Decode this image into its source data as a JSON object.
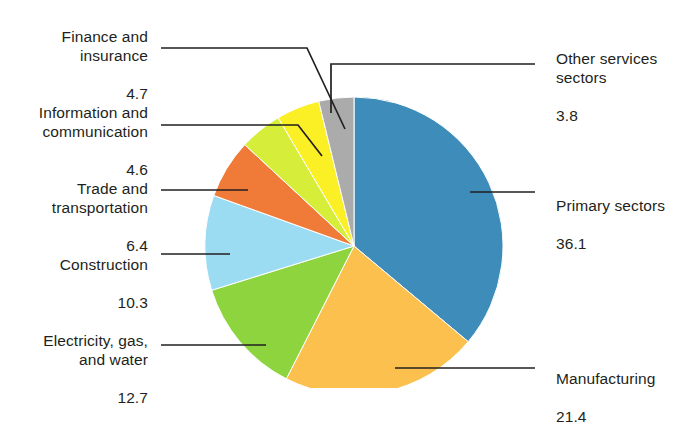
{
  "chart_data": {
    "type": "pie",
    "title": "",
    "subtitle": "",
    "unit": "percent",
    "total": 100.0,
    "legend_position": "callout-labels",
    "categories": [
      "Primary sectors",
      "Manufacturing",
      "Electricity, gas, and water",
      "Construction",
      "Trade and transportation",
      "Information and communication",
      "Finance and insurance",
      "Other services sectors"
    ],
    "values": [
      36.1,
      21.4,
      12.7,
      10.3,
      6.4,
      4.6,
      4.7,
      3.8
    ],
    "colors": [
      "#3e8cba",
      "#fbc04e",
      "#8dd43f",
      "#9bdcf3",
      "#f07b38",
      "#d6ed3a",
      "#fbef25",
      "#ababab"
    ],
    "start_angle_deg": 0,
    "direction": "clockwise",
    "slices": [
      {
        "label": "Primary sectors",
        "value": 36.1,
        "color": "#3e8cba"
      },
      {
        "label": "Manufacturing",
        "value": 21.4,
        "color": "#fbc04e"
      },
      {
        "label": "Electricity, gas, and water",
        "value": 12.7,
        "color": "#8dd43f"
      },
      {
        "label": "Construction",
        "value": 10.3,
        "color": "#9bdcf3"
      },
      {
        "label": "Trade and transportation",
        "value": 6.4,
        "color": "#f07b38"
      },
      {
        "label": "Information and communication",
        "value": 4.6,
        "color": "#d6ed3a"
      },
      {
        "label": "Finance and insurance",
        "value": 4.7,
        "color": "#fbef25"
      },
      {
        "label": "Other services sectors",
        "value": 3.8,
        "color": "#ababab"
      }
    ]
  },
  "labels": {
    "finance": {
      "name": "Finance and\ninsurance",
      "value": "4.7"
    },
    "information": {
      "name": "Information and\ncommunication",
      "value": "4.6"
    },
    "trade": {
      "name": "Trade and\ntransportation",
      "value": "6.4"
    },
    "construction": {
      "name": "Construction",
      "value": "10.3"
    },
    "electricity": {
      "name": "Electricity, gas,\nand water",
      "value": "12.7"
    },
    "other_services": {
      "name": "Other services\nsectors",
      "value": "3.8"
    },
    "primary": {
      "name": "Primary sectors",
      "value": "36.1"
    },
    "manufacturing": {
      "name": "Manufacturing",
      "value": "21.4"
    }
  },
  "style": {
    "leader_line_color": "#231f20",
    "background": "#ffffff",
    "text_color": "#231f20"
  }
}
